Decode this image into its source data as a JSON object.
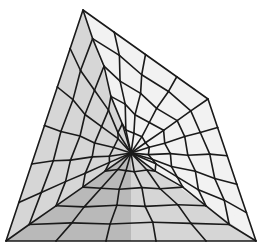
{
  "diagram": {
    "type": "mesh",
    "colors": {
      "edge": "#1a1a1a",
      "fill_light": "#f2f2f2",
      "fill_mid": "#d6d6d6",
      "fill_dark": "#b9b9b9",
      "background": "#ffffff"
    },
    "rings": 5,
    "spokes_per_side": [
      3,
      4,
      4,
      5
    ],
    "regions": [
      {
        "name": "left-upper",
        "shade": "fill_mid"
      },
      {
        "name": "right-upper",
        "shade": "fill_light"
      },
      {
        "name": "bottom-left",
        "shade": "fill_dark"
      },
      {
        "name": "bottom-right",
        "shade": "fill_mid"
      }
    ]
  }
}
